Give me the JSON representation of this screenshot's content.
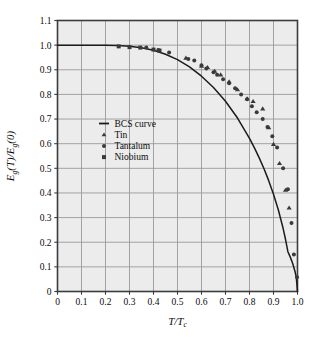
{
  "figure": {
    "background_color": "#ffffff",
    "plot_background_color": "#ececec",
    "grid_color": "#9a9a9a",
    "frame_color": "#3c3c3c",
    "curve_color": "#1c1c1c",
    "marker_color": "#3a3a3a",
    "text_color": "#0b0b0b"
  },
  "chart_data": {
    "type": "scatter",
    "title": "",
    "xlabel": "T/T_c",
    "ylabel": "E_g(T)/E_g(0)",
    "xlim": [
      0,
      1.0
    ],
    "ylim": [
      0,
      1.1
    ],
    "grid": true,
    "legend_position": "center-left",
    "xticks": [
      "0",
      "0.1",
      "0.2",
      "0.3",
      "0.4",
      "0.5",
      "0.6",
      "0.7",
      "0.8",
      "0.9",
      "1.0"
    ],
    "xtick_values": [
      0,
      0.1,
      0.2,
      0.3,
      0.4,
      0.5,
      0.6,
      0.7,
      0.8,
      0.9,
      1.0
    ],
    "yticks": [
      "0",
      "0.1",
      "0.2",
      "0.3",
      "0.4",
      "0.5",
      "0.6",
      "0.7",
      "0.8",
      "0.9",
      "1.0",
      "1.1"
    ],
    "ytick_values": [
      0,
      0.1,
      0.2,
      0.3,
      0.4,
      0.5,
      0.6,
      0.7,
      0.8,
      0.9,
      1.0,
      1.1
    ],
    "series": [
      {
        "name": "BCS curve",
        "marker": "line",
        "x": [
          0.0,
          0.05,
          0.1,
          0.15,
          0.2,
          0.25,
          0.3,
          0.35,
          0.4,
          0.45,
          0.5,
          0.55,
          0.6,
          0.65,
          0.7,
          0.75,
          0.8,
          0.82,
          0.84,
          0.86,
          0.88,
          0.9,
          0.92,
          0.94,
          0.95,
          0.96,
          0.97,
          0.98,
          0.99,
          0.995,
          1.0
        ],
        "values": [
          1.0,
          1.0,
          1.0,
          1.0,
          0.9995,
          0.9985,
          0.9955,
          0.9895,
          0.979,
          0.963,
          0.941,
          0.9115,
          0.874,
          0.828,
          0.772,
          0.704,
          0.6215,
          0.584,
          0.5435,
          0.499,
          0.45,
          0.395,
          0.332,
          0.2565,
          0.212,
          0.1615,
          0.1395,
          0.1135,
          0.08,
          0.057,
          0.0
        ]
      },
      {
        "name": "Tin",
        "marker": "triangle",
        "x": [
          0.535,
          0.6,
          0.625,
          0.655,
          0.68,
          0.715,
          0.75,
          0.79,
          0.815,
          0.855,
          0.88,
          0.9,
          0.925,
          0.95,
          0.965
        ],
        "values": [
          0.948,
          0.915,
          0.91,
          0.895,
          0.88,
          0.852,
          0.82,
          0.783,
          0.772,
          0.742,
          0.665,
          0.598,
          0.52,
          0.412,
          0.34
        ]
      },
      {
        "name": "Tantalum",
        "marker": "circle",
        "x": [
          0.37,
          0.42,
          0.465,
          0.545,
          0.57,
          0.6,
          0.62,
          0.65,
          0.665,
          0.69,
          0.715,
          0.74,
          0.765,
          0.79,
          0.81,
          0.83,
          0.855,
          0.875,
          0.895,
          0.915,
          0.94,
          0.96,
          0.975,
          0.985,
          0.998
        ],
        "values": [
          0.99,
          0.98,
          0.97,
          0.944,
          0.938,
          0.918,
          0.905,
          0.89,
          0.88,
          0.862,
          0.845,
          0.825,
          0.8,
          0.78,
          0.752,
          0.728,
          0.7,
          0.668,
          0.63,
          0.585,
          0.5,
          0.415,
          0.278,
          0.15,
          0.058
        ]
      },
      {
        "name": "Niobium",
        "marker": "square",
        "x": [
          0.255,
          0.3,
          0.345,
          0.4,
          0.425
        ],
        "values": [
          0.995,
          0.992,
          0.99,
          0.982,
          0.978
        ]
      }
    ]
  },
  "legend": {
    "entries": [
      {
        "label": "BCS curve",
        "marker": "line"
      },
      {
        "label": "Tin",
        "marker": "triangle"
      },
      {
        "label": "Tantalum",
        "marker": "circle"
      },
      {
        "label": "Niobium",
        "marker": "square"
      }
    ]
  },
  "axis_labels": {
    "y_main": "E",
    "y_sub": "g",
    "y_rest": "(T)/E",
    "y_sub2": "g",
    "y_end": "(0)",
    "x_main": "T/T",
    "x_sub": "c"
  }
}
